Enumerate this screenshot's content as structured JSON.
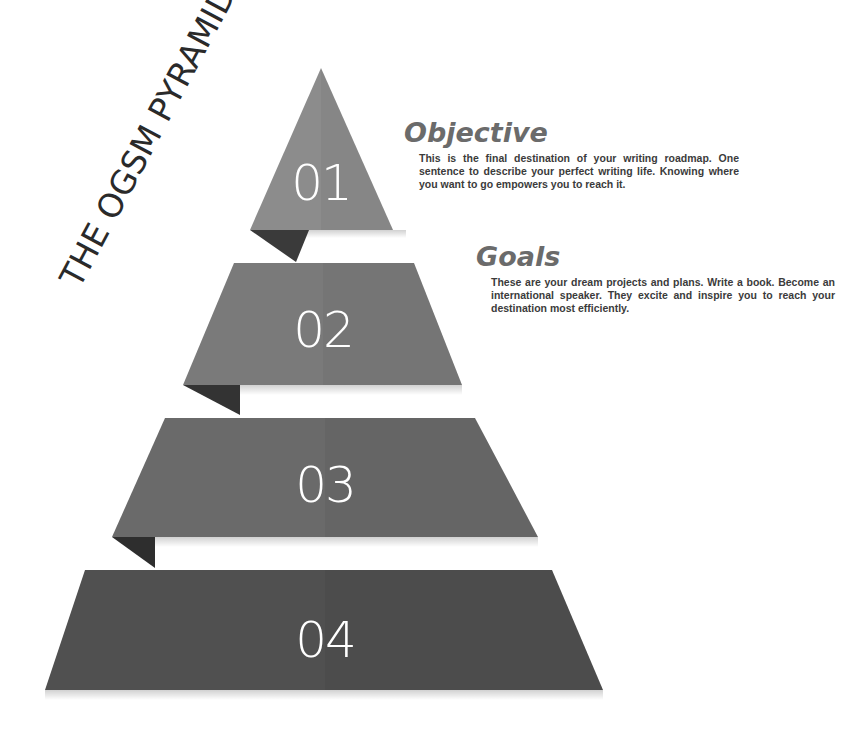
{
  "diagram": {
    "title": "THE OGSM PYRAMID",
    "tiers": [
      {
        "number": "01",
        "color": "#8c8c8c",
        "fold_color": "#3a3a3a"
      },
      {
        "number": "02",
        "color": "#7a7a7a",
        "fold_color": "#333333"
      },
      {
        "number": "03",
        "color": "#6a6a6a",
        "fold_color": "#2e2e2e"
      },
      {
        "number": "04",
        "color": "#505050",
        "fold_color": null
      }
    ],
    "descriptions": [
      {
        "heading": "Objective",
        "text": "This is the final destination of your writing roadmap. One sentence to describe your perfect writing life. Knowing where you want to go empowers you to reach it."
      },
      {
        "heading": "Goals",
        "text": "These are your dream projects and plans. Write a book. Become an international speaker. They excite and inspire you to reach your destination most efficiently."
      }
    ],
    "colors": {
      "background": "#ffffff",
      "heading_text": "#6b6b6b",
      "body_text": "#3b3b3b",
      "title_text": "#2a2a2a"
    }
  }
}
